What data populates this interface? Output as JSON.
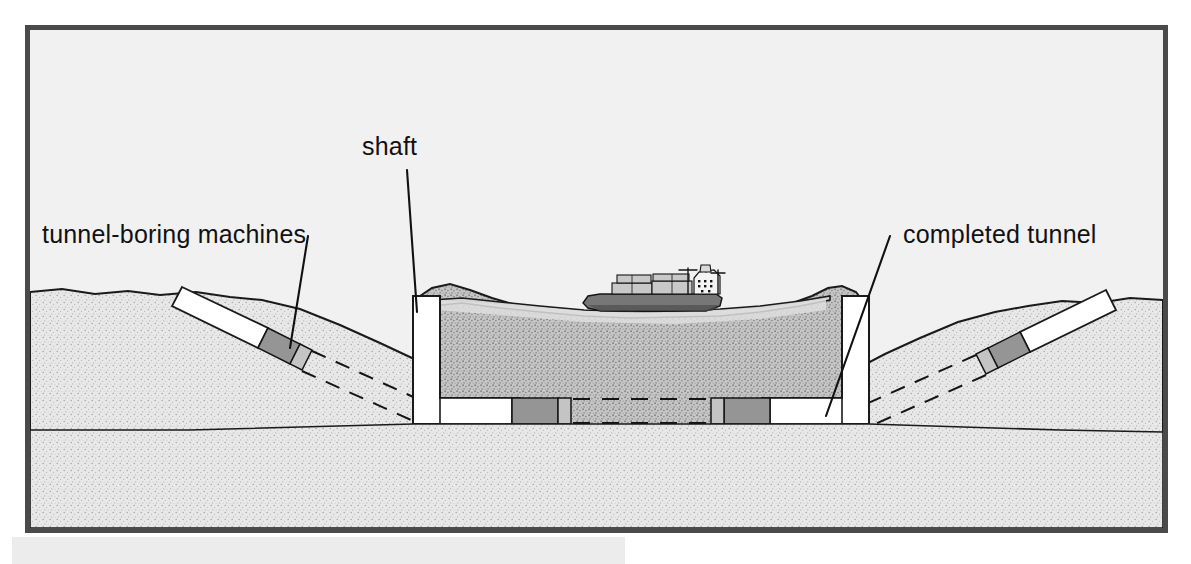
{
  "figure": {
    "frame": {
      "border_color": "#4a4a4a",
      "sky_color": "#f0f0f0",
      "x": 26,
      "y": 26,
      "width": 1141,
      "height": 506
    },
    "caption_block": {
      "present": true,
      "fill_color": "#ececec",
      "x": 12,
      "y": 537,
      "width": 613,
      "height": 27,
      "text": ""
    }
  },
  "labels": [
    {
      "id": "tunnel-boring-machines",
      "text": "tunnel-boring machines",
      "x": 42,
      "y": 243,
      "anchor": "start",
      "leader": {
        "x1": 308,
        "y1": 236,
        "x2": 290,
        "y2": 345
      }
    },
    {
      "id": "shaft",
      "text": "shaft",
      "x": 362,
      "y": 155,
      "anchor": "start",
      "leader": {
        "x1": 407,
        "y1": 170,
        "x2": 417,
        "y2": 312
      }
    },
    {
      "id": "completed-tunnel",
      "text": "completed tunnel",
      "x": 903,
      "y": 243,
      "anchor": "start",
      "leader": {
        "x1": 890,
        "y1": 236,
        "x2": 826,
        "y2": 416
      }
    }
  ],
  "colors": {
    "sky": "#f0f0f0",
    "seabed_light": "#e3e3e3",
    "seabed_mid": "#bdbdbd",
    "seabed_dark": "#a8a8a8",
    "water": "#d2d2d2",
    "tunnel_void": "#ffffff",
    "tbm_body": "#9a9a9a",
    "tbm_head": "#c9c9c9",
    "ship_hull": "#6f6f6f",
    "outline": "#1a1a1a",
    "frame_border": "#4a4a4a"
  },
  "scene": {
    "description": "Cross-section of a sea channel showing shafts sunk on both sides of the waterway, tunnel-boring machines advancing from each shaft and from the shores, dashed lines marking the planned tunnel route, and a completed tunnel bore.",
    "elements": [
      {
        "name": "sky-region",
        "label": "sky / air above ground"
      },
      {
        "name": "left-shore-terrain",
        "label": "left shore ground mass"
      },
      {
        "name": "right-shore-terrain",
        "label": "right shore ground mass"
      },
      {
        "name": "seabed",
        "label": "seabed beneath channel"
      },
      {
        "name": "water-channel",
        "label": "water in channel"
      },
      {
        "name": "cargo-ship",
        "label": "cargo ship on the water surface"
      },
      {
        "name": "left-inclined-bore",
        "label": "inclined tunnel bore from left shore"
      },
      {
        "name": "right-inclined-bore",
        "label": "inclined tunnel bore from right shore"
      },
      {
        "name": "left-shaft",
        "label": "vertical access shaft, left of channel"
      },
      {
        "name": "right-shaft",
        "label": "vertical access shaft, right of channel"
      },
      {
        "name": "central-bore",
        "label": "horizontal tunnel bore under the channel"
      },
      {
        "name": "planned-route-dashes",
        "label": "dashed lines marking unexcavated tunnel route"
      }
    ],
    "tbm_count": 4,
    "shaft_count": 2,
    "ship_count": 1
  }
}
